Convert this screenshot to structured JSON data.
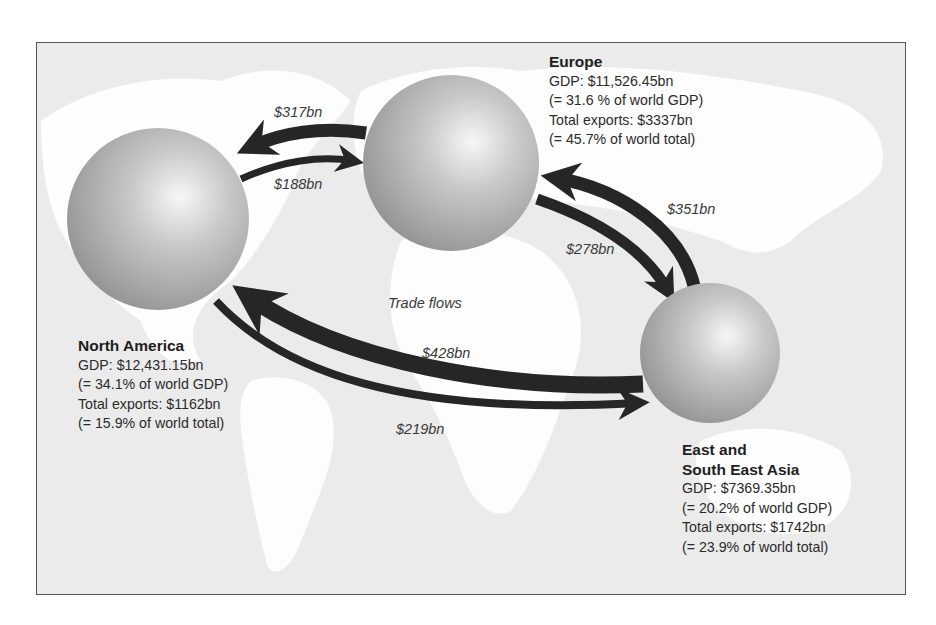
{
  "diagram": {
    "caption": "Trade flows",
    "colors": {
      "ocean": "#ebebeb",
      "land": "#ffffff",
      "arrow": "#262626",
      "sphere_light": "#f4f4f4",
      "sphere_dark": "#8e8e8e",
      "text": "#2b2b2b"
    },
    "regions": [
      {
        "id": "europe",
        "title": "Europe",
        "title_lines": [
          "Europe"
        ],
        "gdp": "GDP: $11,526.45bn",
        "gdp_share": "(= 31.6 % of world GDP)",
        "exports": "Total exports: $3337bn",
        "exports_share": "(= 45.7% of world total)"
      },
      {
        "id": "north-america",
        "title": "North America",
        "title_lines": [
          "North America"
        ],
        "gdp": "GDP: $12,431.15bn",
        "gdp_share": "(= 34.1% of world GDP)",
        "exports": "Total exports: $1162bn",
        "exports_share": "(= 15.9% of world total)"
      },
      {
        "id": "east-south-east-asia",
        "title": "East and South East Asia",
        "title_lines": [
          "East and",
          "South East Asia"
        ],
        "gdp": "GDP: $7369.35bn",
        "gdp_share": "(= 20.2% of world GDP)",
        "exports": "Total exports: $1742bn",
        "exports_share": "(= 23.9% of world total)"
      }
    ],
    "flows": [
      {
        "from": "Europe",
        "to": "North America",
        "label": "$317bn",
        "value": 317
      },
      {
        "from": "North America",
        "to": "Europe",
        "label": "$188bn",
        "value": 188
      },
      {
        "from": "East and South East Asia",
        "to": "Europe",
        "label": "$351bn",
        "value": 351
      },
      {
        "from": "Europe",
        "to": "East and South East Asia",
        "label": "$278bn",
        "value": 278
      },
      {
        "from": "East and South East Asia",
        "to": "North America",
        "label": "$428bn",
        "value": 428
      },
      {
        "from": "North America",
        "to": "East and South East Asia",
        "label": "$219bn",
        "value": 219
      }
    ]
  }
}
